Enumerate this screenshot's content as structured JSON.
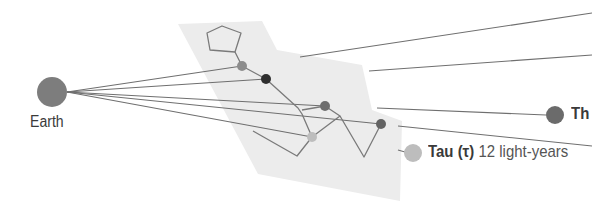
{
  "diagram": {
    "colors": {
      "plane": "#ececec",
      "sight_line": "#6f6f6f",
      "constellation_line": "#7a7a7a",
      "earth": "#7d7d7d"
    },
    "earth": {
      "label": "Earth",
      "cx": 52,
      "cy": 92,
      "r": 15,
      "color": "#7d7d7d"
    },
    "stars": [
      {
        "id": "star-1",
        "cx": 242,
        "cy": 66,
        "r": 5,
        "color": "#8c8c8c"
      },
      {
        "id": "star-2",
        "cx": 266,
        "cy": 79,
        "r": 5,
        "color": "#2f2f2f"
      },
      {
        "id": "star-3",
        "cx": 325,
        "cy": 106,
        "r": 5,
        "color": "#6e6e6e"
      },
      {
        "id": "star-4",
        "cx": 312,
        "cy": 137,
        "r": 5,
        "color": "#bdbdbd"
      },
      {
        "id": "star-5",
        "cx": 381,
        "cy": 124,
        "r": 5,
        "color": "#636363"
      }
    ],
    "labeled_stars": [
      {
        "id": "theta",
        "label": "Th",
        "distance": "",
        "cx": 555,
        "cy": 115,
        "r": 9,
        "color": "#6b6b6b"
      },
      {
        "id": "tau",
        "label": "Tau (τ)",
        "distance": "12 light-years",
        "cx": 413,
        "cy": 153,
        "r": 9,
        "color": "#bdbdbd"
      }
    ],
    "labels": {
      "earth": "Earth",
      "theta": "Th",
      "tau_name": "Tau (τ)",
      "tau_distance": "12 light-years"
    }
  }
}
